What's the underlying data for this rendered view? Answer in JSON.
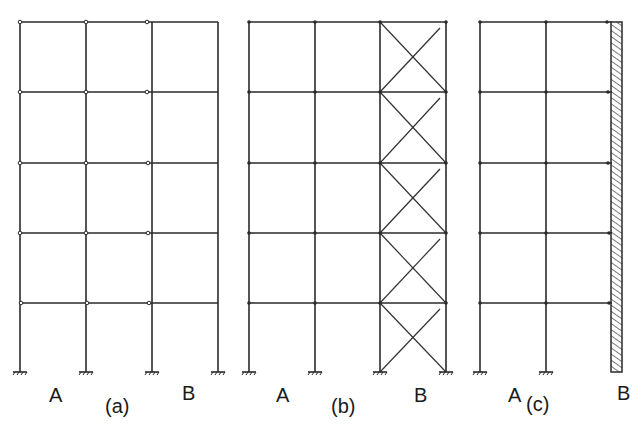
{
  "figure": {
    "stroke_color": "#2a2a2a",
    "panels": [
      {
        "id": "a",
        "caption": "(a)",
        "left_label": "A",
        "right_label": "B",
        "type": "moment-frame"
      },
      {
        "id": "b",
        "caption": "(b)",
        "left_label": "A",
        "right_label": "B",
        "type": "braced-frame"
      },
      {
        "id": "c",
        "caption": "(c)",
        "left_label": "A",
        "right_label": "B",
        "type": "wall-frame"
      }
    ]
  }
}
